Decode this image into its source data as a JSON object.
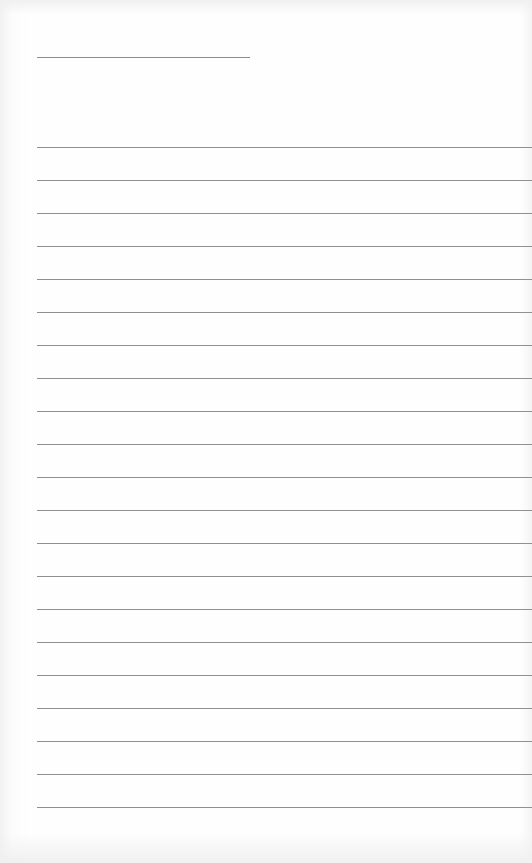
{
  "page": {
    "type": "lined-paper",
    "background_color": "#fefefe",
    "line_color": "#8f8f8f",
    "header_line": {
      "x": 37,
      "y": 57,
      "width": 213
    },
    "ruled_lines": {
      "count": 21,
      "first_y": 147,
      "spacing": 33,
      "x": 37
    }
  }
}
